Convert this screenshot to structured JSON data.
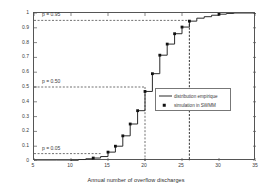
{
  "chart_data": {
    "type": "line",
    "title": "",
    "xlabel": "Annual number of overflow discharges",
    "ylabel": "CDF",
    "xlim": [
      5,
      35
    ],
    "ylim": [
      0,
      1
    ],
    "xticks": [
      5,
      10,
      15,
      20,
      25,
      30,
      35
    ],
    "yticks": [
      0,
      0.1,
      0.2,
      0.3,
      0.4,
      0.5,
      0.6,
      0.7,
      0.8,
      0.9,
      1
    ],
    "xtick_labels": [
      "5",
      "10",
      "15",
      "20",
      "25",
      "30",
      "35"
    ],
    "ytick_labels": [
      "0",
      "0.1",
      "0.2",
      "0.3",
      "0.4",
      "0.5",
      "0.6",
      "0.7",
      "0.8",
      "0.9",
      "1"
    ],
    "grid": false,
    "legend_position": "center-right",
    "series": [
      {
        "name": "distribution empirique",
        "style": "step-line",
        "color": "#2b2b2b",
        "x": [
          5,
          8,
          10,
          11,
          12,
          13,
          14,
          15,
          16,
          17,
          18,
          19,
          20,
          21,
          22,
          23,
          24,
          25,
          26,
          27,
          28,
          29,
          30,
          31,
          32,
          35
        ],
        "y": [
          0.0,
          0.0,
          0.005,
          0.01,
          0.015,
          0.02,
          0.03,
          0.06,
          0.1,
          0.17,
          0.25,
          0.34,
          0.47,
          0.59,
          0.715,
          0.79,
          0.86,
          0.905,
          0.945,
          0.965,
          0.975,
          0.985,
          0.992,
          0.997,
          1.0,
          1.0
        ]
      },
      {
        "name": "simulation in SWMM",
        "style": "markers",
        "color": "#111111",
        "x": [
          13,
          15,
          16,
          17,
          18,
          19,
          20,
          21,
          22,
          23,
          24,
          25,
          26,
          30
        ],
        "y": [
          0.02,
          0.06,
          0.1,
          0.17,
          0.25,
          0.34,
          0.47,
          0.59,
          0.715,
          0.79,
          0.86,
          0.905,
          0.945,
          0.992
        ]
      }
    ],
    "annotations": [
      {
        "label": "p = 0.95",
        "p": 0.95,
        "x_intercept": 26
      },
      {
        "label": "p = 0.50",
        "p": 0.5,
        "x_intercept": 20
      },
      {
        "label": "p = 0.05",
        "p": 0.05,
        "x_intercept": 14
      }
    ]
  },
  "legend": {
    "entries": [
      {
        "label": "distribution empirique",
        "key": "line-key"
      },
      {
        "label": "simulation in SWMM",
        "key": "square-marker-key"
      }
    ]
  },
  "axes": {
    "x_title": "Annual number of overflow discharges",
    "y_title": "CDF"
  },
  "annotation_labels": {
    "p95": "p = 0.95",
    "p50": "p = 0.50",
    "p05": "p = 0.05"
  }
}
